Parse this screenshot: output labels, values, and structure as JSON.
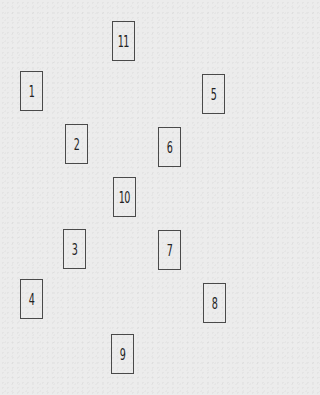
{
  "diagram": {
    "type": "card-spread-layout",
    "cards": [
      {
        "label": "1",
        "x": 20,
        "y": 71
      },
      {
        "label": "2",
        "x": 65,
        "y": 124
      },
      {
        "label": "3",
        "x": 63,
        "y": 229
      },
      {
        "label": "4",
        "x": 20,
        "y": 279
      },
      {
        "label": "5",
        "x": 202,
        "y": 74
      },
      {
        "label": "6",
        "x": 158,
        "y": 127
      },
      {
        "label": "7",
        "x": 158,
        "y": 230
      },
      {
        "label": "8",
        "x": 203,
        "y": 283
      },
      {
        "label": "9",
        "x": 111,
        "y": 334
      },
      {
        "label": "10",
        "x": 113,
        "y": 177
      },
      {
        "label": "11",
        "x": 112,
        "y": 21
      }
    ]
  }
}
